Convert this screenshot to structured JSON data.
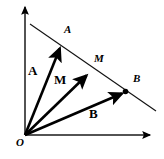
{
  "figure": {
    "background_color": "#ffffff",
    "stroke_color": "#000000",
    "width": 164,
    "height": 159
  },
  "axes": {
    "origin": {
      "x": 25,
      "y": 135
    },
    "x_axis": {
      "x1": 25,
      "y1": 135,
      "x2": 152,
      "y2": 135,
      "label": ""
    },
    "y_axis": {
      "x1": 25,
      "y1": 135,
      "x2": 25,
      "y2": 6,
      "label": ""
    },
    "origin_label": "O"
  },
  "points": {
    "A": {
      "x": 61,
      "y": 45,
      "label": "A"
    },
    "M": {
      "x": 89,
      "y": 73,
      "label": "M"
    },
    "B": {
      "x": 125,
      "y": 92,
      "label": "B"
    }
  },
  "vectors": [
    {
      "name": "vector-a",
      "label": "A",
      "from": {
        "x": 25,
        "y": 135
      },
      "to": {
        "x": 61,
        "y": 45
      },
      "label_pos": {
        "x": 29,
        "y": 65
      }
    },
    {
      "name": "vector-m",
      "label": "M",
      "from": {
        "x": 25,
        "y": 135
      },
      "to": {
        "x": 89,
        "y": 73
      },
      "label_pos": {
        "x": 55,
        "y": 73
      }
    },
    {
      "name": "vector-b",
      "label": "B",
      "from": {
        "x": 25,
        "y": 135
      },
      "to": {
        "x": 125,
        "y": 92
      },
      "label_pos": {
        "x": 90,
        "y": 109
      }
    }
  ],
  "segment_line": {
    "name": "line-through-a-m-b",
    "from": {
      "x": 30,
      "y": 24
    },
    "to": {
      "x": 156,
      "y": 111
    }
  },
  "point_labels": {
    "a_italic": {
      "text": "A",
      "x": 64,
      "y": 24
    },
    "m_italic": {
      "text": "M",
      "x": 94,
      "y": 53
    },
    "b_italic": {
      "text": "B",
      "x": 133,
      "y": 73
    }
  },
  "bold_labels": {
    "a_bold": {
      "text": "A",
      "x": 28,
      "y": 64
    },
    "m_bold": {
      "text": "M",
      "x": 54,
      "y": 73
    },
    "b_bold": {
      "text": "B",
      "x": 89,
      "y": 107
    }
  },
  "origin_label": {
    "text": "O",
    "x": 16,
    "y": 137
  }
}
